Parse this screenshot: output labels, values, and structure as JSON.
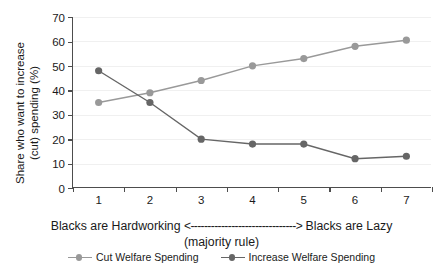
{
  "chart_data": {
    "type": "line",
    "title": "",
    "xlabel": "Blacks are Hardworking <-------------------------------> Blacks are Lazy (majority rule)",
    "ylabel": "Share who want to increase (cut) spending (%)",
    "categories": [
      "1",
      "2",
      "3",
      "4",
      "5",
      "6",
      "7"
    ],
    "x": [
      1,
      2,
      3,
      4,
      5,
      6,
      7
    ],
    "ylim": [
      0,
      70
    ],
    "xlim": [
      0.5,
      7.5
    ],
    "yticks": [
      0,
      10,
      20,
      30,
      40,
      50,
      60,
      70
    ],
    "grid": true,
    "legend_position": "bottom",
    "series": [
      {
        "name": "Cut Welfare Spending",
        "color": "#999999",
        "values": [
          35,
          39,
          44,
          50,
          53,
          58,
          60.5
        ]
      },
      {
        "name": "Increase Welfare Spending",
        "color": "#666666",
        "values": [
          48,
          35,
          20,
          18,
          18,
          12,
          13
        ]
      }
    ]
  },
  "axes": {
    "ylabel_line1": "Share who want to increase",
    "ylabel_line2": "(cut) spending (%)",
    "ytick_labels": [
      "70",
      "60",
      "50",
      "40",
      "30",
      "20",
      "10",
      "0"
    ],
    "xtick_labels": [
      "1",
      "2",
      "3",
      "4",
      "5",
      "6",
      "7"
    ]
  },
  "caption": {
    "left_text": "Blacks are Hardworking",
    "arrow": "<------------------------------->",
    "right_text": "Blacks are Lazy",
    "sub_text": "(majority rule)"
  },
  "legend": {
    "items": [
      {
        "label": "Cut Welfare Spending",
        "color": "#999999"
      },
      {
        "label": "Increase Welfare Spending",
        "color": "#666666"
      }
    ]
  }
}
